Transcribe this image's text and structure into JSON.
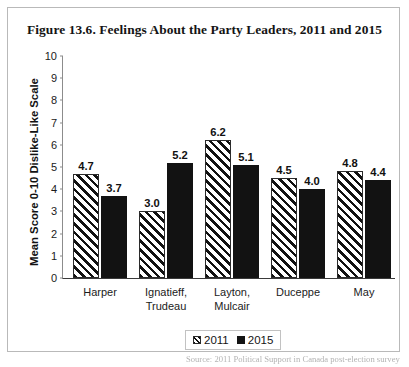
{
  "figure": {
    "title": "Figure 13.6. Feelings About the Party Leaders, 2011 and 2015",
    "source_note": "Source: 2011 Political Support in Canada post-election survey"
  },
  "legend": {
    "entries": [
      {
        "label": "2011",
        "swatch": "hatched-swatch-icon"
      },
      {
        "label": "2015",
        "swatch": "solid-black-swatch-icon"
      }
    ]
  },
  "chart_data": {
    "type": "bar",
    "title": "Figure 13.6. Feelings About the Party Leaders, 2011 and 2015",
    "xlabel": "",
    "ylabel": "Mean Score 0-10 Dislike-Like Scale",
    "ylim": [
      0,
      10
    ],
    "yticks": [
      0,
      1,
      2,
      3,
      4,
      5,
      6,
      7,
      8,
      9,
      10
    ],
    "grid": false,
    "legend_position": "bottom-center",
    "categories": [
      "Harper",
      "Ignatieff,\nTrudeau",
      "Layton,\nMulcair",
      "Duceppe",
      "May"
    ],
    "category_lines": [
      [
        "Harper"
      ],
      [
        "Ignatieff,",
        "Trudeau"
      ],
      [
        "Layton,",
        "Mulcair"
      ],
      [
        "Duceppe"
      ],
      [
        "May"
      ]
    ],
    "series": [
      {
        "name": "2011",
        "values": [
          4.7,
          3.0,
          6.2,
          4.5,
          4.8
        ],
        "labels": [
          "4.7",
          "3.0",
          "6.2",
          "4.5",
          "4.8"
        ]
      },
      {
        "name": "2015",
        "values": [
          3.7,
          5.2,
          5.1,
          4.0,
          4.4
        ],
        "labels": [
          "3.7",
          "5.2",
          "5.1",
          "4.0",
          "4.4"
        ]
      }
    ]
  }
}
